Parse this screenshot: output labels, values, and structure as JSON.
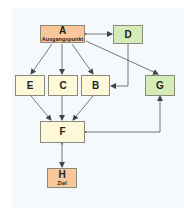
{
  "nodes": {
    "A": {
      "label": "A",
      "sub": "Ausgangspunkt",
      "color": "#f8c89a"
    },
    "B": {
      "label": "B",
      "color": "#fdf8d8"
    },
    "C": {
      "label": "C",
      "color": "#fdf8d8"
    },
    "D": {
      "label": "D",
      "color": "#d4ecb8"
    },
    "E": {
      "label": "E",
      "color": "#fdf8d8"
    },
    "F": {
      "label": "F",
      "color": "#fdf8d8"
    },
    "G": {
      "label": "G",
      "color": "#d4ecb8"
    },
    "H": {
      "label": "H",
      "sub": "Ziel",
      "color": "#f8c89a"
    }
  },
  "edges": [
    {
      "from": "A",
      "to": "D",
      "bidirectional": true
    },
    {
      "from": "A",
      "to": "E"
    },
    {
      "from": "A",
      "to": "C"
    },
    {
      "from": "A",
      "to": "B"
    },
    {
      "from": "A",
      "to": "G"
    },
    {
      "from": "D",
      "to": "B"
    },
    {
      "from": "E",
      "to": "F"
    },
    {
      "from": "C",
      "to": "F"
    },
    {
      "from": "B",
      "to": "F"
    },
    {
      "from": "F",
      "to": "G",
      "bidirectional": true
    },
    {
      "from": "F",
      "to": "H",
      "bidirectional": true
    }
  ]
}
